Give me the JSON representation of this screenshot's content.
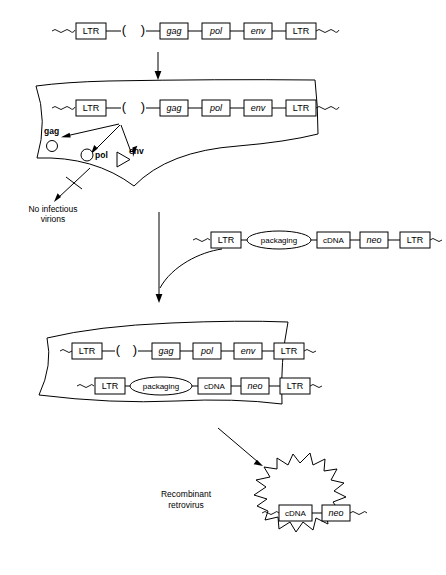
{
  "figure": {
    "ink_color": "#000000",
    "background_color": "#ffffff"
  },
  "constructs": {
    "helper_provirus": {
      "name": "helper-provirus-construct",
      "deleted_packaging_signal": {
        "left_paren": "(",
        "right_paren": ")"
      },
      "elements": [
        {
          "label": "LTR",
          "shape": "box",
          "style": "roman"
        },
        {
          "label": "gag",
          "shape": "box",
          "style": "italic"
        },
        {
          "label": "pol",
          "shape": "box",
          "style": "italic"
        },
        {
          "label": "env",
          "shape": "box",
          "style": "italic"
        },
        {
          "label": "LTR",
          "shape": "box",
          "style": "roman"
        }
      ]
    },
    "retroviral_vector": {
      "name": "retroviral-vector-construct",
      "elements": [
        {
          "label": "LTR",
          "shape": "box",
          "style": "roman"
        },
        {
          "label": "packaging",
          "shape": "oval",
          "style": "roman"
        },
        {
          "label": "cDNA",
          "shape": "box",
          "style": "roman"
        },
        {
          "label": "neo",
          "shape": "box",
          "style": "italic"
        },
        {
          "label": "LTR",
          "shape": "box",
          "style": "roman"
        }
      ]
    },
    "virion_genome": {
      "name": "virion-genome-construct",
      "elements": [
        {
          "label": "cDNA",
          "shape": "box",
          "style": "roman"
        },
        {
          "label": "neo",
          "shape": "box",
          "style": "italic"
        }
      ]
    }
  },
  "proteins": [
    {
      "label": "gag",
      "symbol": "small-circle"
    },
    {
      "label": "pol",
      "symbol": "circle"
    },
    {
      "label": "env",
      "symbol": "triangle"
    }
  ],
  "annotations": {
    "no_infectious_virions_line1": "No infectious",
    "no_infectious_virions_line2": "virions",
    "recombinant_retrovirus_line1": "Recombinant",
    "recombinant_retrovirus_line2": "retrovirus"
  },
  "stages": [
    {
      "name": "free-helper-provirus",
      "caption": ""
    },
    {
      "name": "packaging-cell-expressing-gag-pol-env",
      "caption": ""
    },
    {
      "name": "packaging-cell-with-vector",
      "caption": ""
    },
    {
      "name": "released-recombinant-virion",
      "caption": ""
    }
  ]
}
